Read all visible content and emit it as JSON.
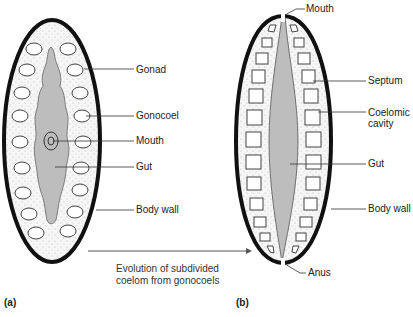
{
  "figure": {
    "panel_a": {
      "tag": "(a)",
      "labels": {
        "gonad": "Gonad",
        "gonocoel": "Gonocoel",
        "mouth": "Mouth",
        "gut": "Gut",
        "body_wall": "Body wall"
      }
    },
    "panel_b": {
      "tag": "(b)",
      "labels": {
        "mouth": "Mouth",
        "septum": "Septum",
        "coelomic_1": "Coelomic",
        "coelomic_2": "cavity",
        "gut": "Gut",
        "body_wall": "Body wall",
        "anus": "Anus"
      }
    },
    "arrow_caption": {
      "line1": "Evolution of subdivided",
      "line2": "coelom from gonocoels"
    },
    "colors": {
      "outline": "#111111",
      "gut_fill": "#bdbdbd",
      "body_fill": "#f4f4f4",
      "leader": "#333333"
    }
  }
}
